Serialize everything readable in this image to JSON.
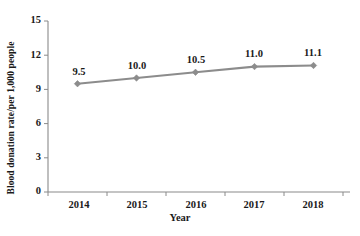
{
  "chart_data": {
    "type": "line",
    "title": "",
    "xlabel": "Year",
    "ylabel": "Blood donation rate/per 1,000 people",
    "categories": [
      "2014",
      "2015",
      "2016",
      "2017",
      "2018"
    ],
    "values": [
      9.5,
      10.0,
      10.5,
      11.0,
      11.1
    ],
    "point_labels": [
      "9.5",
      "10.0",
      "10.5",
      "11.0",
      "11.1"
    ],
    "ylim": [
      0,
      15
    ],
    "yticks": [
      0,
      3,
      6,
      9,
      12,
      15
    ],
    "ytick_labels": [
      "0",
      "3",
      "6",
      "9",
      "12",
      "15"
    ],
    "grid": false,
    "legend": "none",
    "series_color": "#8c8c8c",
    "marker": "diamond",
    "axis_color": "#8a8a8a"
  }
}
